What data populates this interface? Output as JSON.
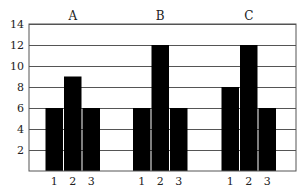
{
  "chart_data": {
    "type": "bar",
    "title": "",
    "xlabel": "",
    "ylabel": "",
    "panels": [
      "A",
      "B",
      "C"
    ],
    "categories": [
      "1",
      "2",
      "3"
    ],
    "series": [
      {
        "name": "A",
        "values": [
          6,
          9,
          6
        ]
      },
      {
        "name": "B",
        "values": [
          6,
          12,
          6
        ]
      },
      {
        "name": "C",
        "values": [
          8,
          12,
          6
        ]
      }
    ],
    "ylim": [
      0,
      14
    ],
    "yticks": [
      2,
      4,
      6,
      8,
      10,
      12,
      14
    ],
    "grid": true,
    "bar_color": "#000000",
    "grid_color": "#555555",
    "legend": "none"
  }
}
